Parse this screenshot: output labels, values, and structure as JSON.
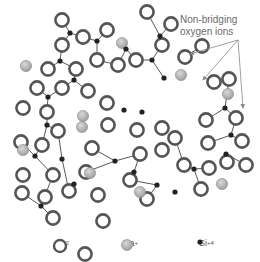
{
  "callout": {
    "line1": "Non-bridging",
    "line2": "oxygen ions"
  },
  "legend": [
    {
      "symbol": "ring",
      "label": "O",
      "superscript": "−2",
      "name": "oxygen"
    },
    {
      "symbol": "shaded-circle",
      "label": "Na",
      "superscript": "+",
      "name": "sodium"
    },
    {
      "symbol": "dot",
      "label": "Si",
      "superscript": "+4",
      "name": "silicon"
    }
  ],
  "colors": {
    "oxygen_ring": "#555555",
    "oxygen_fill": "#ffffff",
    "sodium_fill": "#b8b8b8",
    "silicon": "#222222",
    "bond": "#444444",
    "text": "#6a6a6a",
    "arrow": "#888888"
  },
  "atoms": {
    "oxygen": [
      [
        62,
        20
      ],
      [
        83,
        37
      ],
      [
        62,
        45
      ],
      [
        48,
        69
      ],
      [
        76,
        69
      ],
      [
        37,
        88
      ],
      [
        62,
        88
      ],
      [
        88,
        91
      ],
      [
        47,
        112
      ],
      [
        23,
        108
      ],
      [
        107,
        30
      ],
      [
        97,
        60
      ],
      [
        118,
        65
      ],
      [
        136,
        60
      ],
      [
        162,
        45
      ],
      [
        171,
        24
      ],
      [
        147,
        12
      ],
      [
        107,
        103
      ],
      [
        108,
        125
      ],
      [
        137,
        130
      ],
      [
        162,
        128
      ],
      [
        162,
        150
      ],
      [
        185,
        57
      ],
      [
        202,
        46
      ],
      [
        214,
        82
      ],
      [
        229,
        79
      ],
      [
        206,
        120
      ],
      [
        208,
        143
      ],
      [
        236,
        118
      ],
      [
        242,
        141
      ],
      [
        21,
        142
      ],
      [
        42,
        145
      ],
      [
        58,
        131
      ],
      [
        53,
        175
      ],
      [
        22,
        193
      ],
      [
        45,
        197
      ],
      [
        69,
        191
      ],
      [
        53,
        218
      ],
      [
        92,
        148
      ],
      [
        86,
        172
      ],
      [
        98,
        195
      ],
      [
        103,
        221
      ],
      [
        130,
        180
      ],
      [
        147,
        199
      ],
      [
        140,
        154
      ],
      [
        175,
        138
      ],
      [
        184,
        165
      ],
      [
        209,
        168
      ],
      [
        227,
        162
      ],
      [
        201,
        189
      ],
      [
        246,
        165
      ],
      [
        23,
        175
      ],
      [
        85,
        254
      ]
    ],
    "sodium": [
      [
        26,
        66
      ],
      [
        83,
        116
      ],
      [
        82,
        127
      ],
      [
        122,
        43
      ],
      [
        181,
        75
      ],
      [
        228,
        94
      ],
      [
        23,
        150
      ],
      [
        90,
        173
      ],
      [
        140,
        192
      ],
      [
        222,
        184
      ]
    ],
    "silicon": [
      [
        70,
        33
      ],
      [
        60,
        61
      ],
      [
        74,
        80
      ],
      [
        48,
        97
      ],
      [
        97,
        41
      ],
      [
        126,
        49
      ],
      [
        160,
        36
      ],
      [
        152,
        60
      ],
      [
        164,
        78
      ],
      [
        124,
        110
      ],
      [
        142,
        112
      ],
      [
        225,
        108
      ],
      [
        231,
        135
      ],
      [
        47,
        125
      ],
      [
        35,
        156
      ],
      [
        62,
        159
      ],
      [
        74,
        184
      ],
      [
        41,
        206
      ],
      [
        115,
        161
      ],
      [
        134,
        172
      ],
      [
        157,
        185
      ],
      [
        175,
        192
      ],
      [
        194,
        169
      ],
      [
        226,
        154
      ]
    ]
  },
  "bonds": [
    [
      [
        62,
        20
      ],
      [
        70,
        33
      ]
    ],
    [
      [
        70,
        33
      ],
      [
        83,
        37
      ]
    ],
    [
      [
        70,
        33
      ],
      [
        62,
        45
      ]
    ],
    [
      [
        62,
        45
      ],
      [
        60,
        61
      ]
    ],
    [
      [
        60,
        61
      ],
      [
        48,
        69
      ]
    ],
    [
      [
        60,
        61
      ],
      [
        76,
        69
      ]
    ],
    [
      [
        76,
        69
      ],
      [
        74,
        80
      ]
    ],
    [
      [
        74,
        80
      ],
      [
        62,
        88
      ]
    ],
    [
      [
        74,
        80
      ],
      [
        88,
        91
      ]
    ],
    [
      [
        37,
        88
      ],
      [
        48,
        97
      ]
    ],
    [
      [
        48,
        97
      ],
      [
        62,
        88
      ]
    ],
    [
      [
        48,
        97
      ],
      [
        47,
        112
      ]
    ],
    [
      [
        107,
        30
      ],
      [
        97,
        41
      ]
    ],
    [
      [
        97,
        41
      ],
      [
        83,
        37
      ]
    ],
    [
      [
        97,
        41
      ],
      [
        97,
        60
      ]
    ],
    [
      [
        97,
        60
      ],
      [
        118,
        65
      ]
    ],
    [
      [
        118,
        65
      ],
      [
        126,
        49
      ]
    ],
    [
      [
        126,
        49
      ],
      [
        136,
        60
      ]
    ],
    [
      [
        147,
        12
      ],
      [
        160,
        36
      ]
    ],
    [
      [
        160,
        36
      ],
      [
        162,
        45
      ]
    ],
    [
      [
        160,
        36
      ],
      [
        171,
        24
      ]
    ],
    [
      [
        136,
        60
      ],
      [
        152,
        60
      ]
    ],
    [
      [
        152,
        60
      ],
      [
        162,
        45
      ]
    ],
    [
      [
        152,
        60
      ],
      [
        164,
        78
      ]
    ],
    [
      [
        185,
        57
      ],
      [
        202,
        46
      ]
    ],
    [
      [
        47,
        112
      ],
      [
        47,
        125
      ]
    ],
    [
      [
        47,
        125
      ],
      [
        42,
        145
      ]
    ],
    [
      [
        47,
        125
      ],
      [
        58,
        131
      ]
    ],
    [
      [
        21,
        142
      ],
      [
        35,
        156
      ]
    ],
    [
      [
        35,
        156
      ],
      [
        42,
        145
      ]
    ],
    [
      [
        35,
        156
      ],
      [
        53,
        175
      ]
    ],
    [
      [
        58,
        131
      ],
      [
        62,
        159
      ]
    ],
    [
      [
        62,
        159
      ],
      [
        69,
        191
      ]
    ],
    [
      [
        53,
        175
      ],
      [
        41,
        206
      ]
    ],
    [
      [
        41,
        206
      ],
      [
        22,
        193
      ]
    ],
    [
      [
        41,
        206
      ],
      [
        45,
        197
      ]
    ],
    [
      [
        41,
        206
      ],
      [
        53,
        218
      ]
    ],
    [
      [
        92,
        148
      ],
      [
        115,
        161
      ]
    ],
    [
      [
        115,
        161
      ],
      [
        140,
        154
      ]
    ],
    [
      [
        115,
        161
      ],
      [
        86,
        172
      ]
    ],
    [
      [
        130,
        180
      ],
      [
        134,
        172
      ]
    ],
    [
      [
        134,
        172
      ],
      [
        140,
        154
      ]
    ],
    [
      [
        147,
        199
      ],
      [
        157,
        185
      ]
    ],
    [
      [
        157,
        185
      ],
      [
        130,
        180
      ]
    ],
    [
      [
        175,
        138
      ],
      [
        184,
        165
      ]
    ],
    [
      [
        184,
        165
      ],
      [
        194,
        169
      ]
    ],
    [
      [
        194,
        169
      ],
      [
        209,
        168
      ]
    ],
    [
      [
        194,
        169
      ],
      [
        201,
        189
      ]
    ],
    [
      [
        206,
        120
      ],
      [
        225,
        108
      ]
    ],
    [
      [
        225,
        108
      ],
      [
        236,
        118
      ]
    ],
    [
      [
        225,
        108
      ],
      [
        229,
        79
      ]
    ],
    [
      [
        208,
        143
      ],
      [
        231,
        135
      ]
    ],
    [
      [
        231,
        135
      ],
      [
        242,
        141
      ]
    ],
    [
      [
        231,
        135
      ],
      [
        236,
        118
      ]
    ],
    [
      [
        227,
        162
      ],
      [
        226,
        154
      ]
    ],
    [
      [
        226,
        154
      ],
      [
        246,
        165
      ]
    ]
  ],
  "arrows": [
    {
      "from": [
        238,
        40
      ],
      "to": [
        190,
        54
      ]
    },
    {
      "from": [
        238,
        40
      ],
      "to": [
        203,
        80
      ]
    },
    {
      "from": [
        238,
        40
      ],
      "to": [
        243,
        108
      ]
    }
  ]
}
